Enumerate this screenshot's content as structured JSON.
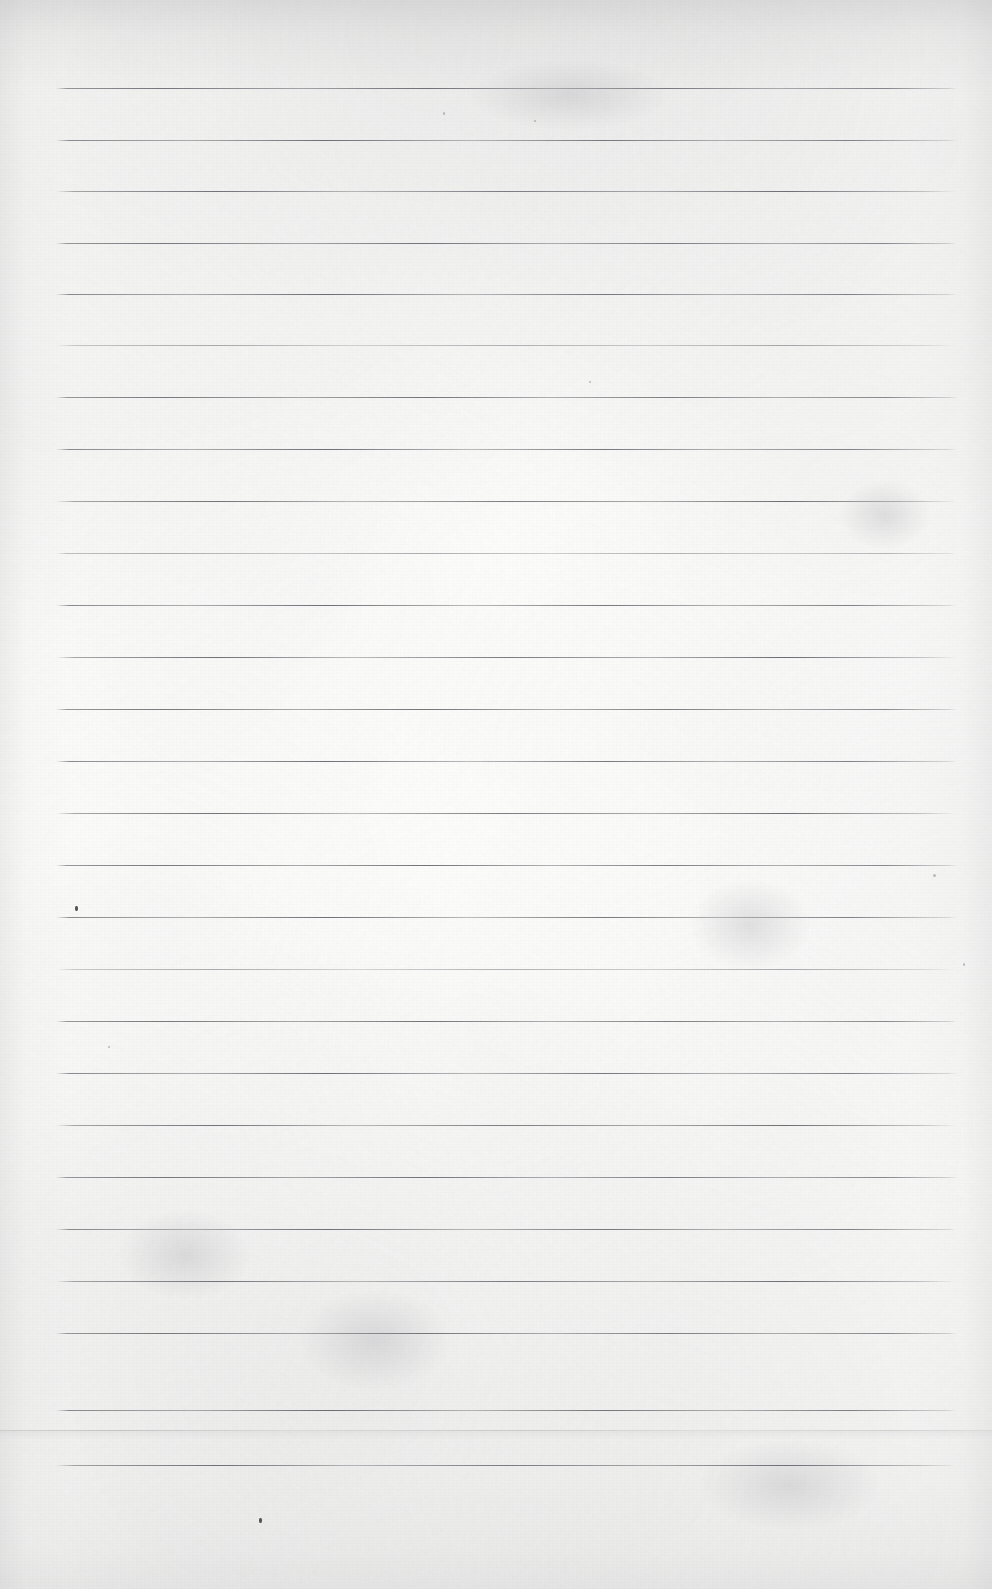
{
  "document": {
    "kind": "scanned-blank-ruled-notebook-page",
    "description": "Blank lined (ruled) sheet of notebook paper, scanned. No handwriting or printed text.",
    "page_width": 992,
    "page_height": 1589,
    "paper_color": "#fbfbfa",
    "rule_color": "#6a6870",
    "seam_color": "#969699",
    "speck_color": "#28262c",
    "text_content": ""
  },
  "ruling": {
    "line_count": 27,
    "line_left_x": 56,
    "line_right_x": 957,
    "line_length": 901,
    "line_spacing": 52,
    "first_line_y": 88,
    "last_line_y": 1465,
    "line_thickness": 1,
    "lines": [
      {
        "index": 1,
        "y": 88,
        "variant": "v1",
        "weight": "strong"
      },
      {
        "index": 2,
        "y": 140,
        "variant": "v2",
        "weight": "normal"
      },
      {
        "index": 3,
        "y": 191,
        "variant": "v3",
        "weight": "normal"
      },
      {
        "index": 4,
        "y": 243,
        "variant": "v1",
        "weight": "normal"
      },
      {
        "index": 5,
        "y": 294,
        "variant": "v2",
        "weight": "strong"
      },
      {
        "index": 6,
        "y": 345,
        "variant": "v3",
        "weight": "faint"
      },
      {
        "index": 7,
        "y": 397,
        "variant": "v1",
        "weight": "normal"
      },
      {
        "index": 8,
        "y": 449,
        "variant": "v2",
        "weight": "normal"
      },
      {
        "index": 9,
        "y": 501,
        "variant": "v3",
        "weight": "normal"
      },
      {
        "index": 10,
        "y": 553,
        "variant": "v1",
        "weight": "faint"
      },
      {
        "index": 11,
        "y": 605,
        "variant": "v2",
        "weight": "normal"
      },
      {
        "index": 12,
        "y": 657,
        "variant": "v3",
        "weight": "strong"
      },
      {
        "index": 13,
        "y": 709,
        "variant": "v1",
        "weight": "normal"
      },
      {
        "index": 14,
        "y": 761,
        "variant": "v2",
        "weight": "normal"
      },
      {
        "index": 15,
        "y": 813,
        "variant": "v3",
        "weight": "normal"
      },
      {
        "index": 16,
        "y": 865,
        "variant": "v1",
        "weight": "normal"
      },
      {
        "index": 17,
        "y": 917,
        "variant": "v2",
        "weight": "normal"
      },
      {
        "index": 18,
        "y": 969,
        "variant": "v3",
        "weight": "faint"
      },
      {
        "index": 19,
        "y": 1021,
        "variant": "v1",
        "weight": "normal"
      },
      {
        "index": 20,
        "y": 1073,
        "variant": "v2",
        "weight": "normal"
      },
      {
        "index": 21,
        "y": 1125,
        "variant": "v3",
        "weight": "normal"
      },
      {
        "index": 22,
        "y": 1177,
        "variant": "v1",
        "weight": "strong"
      },
      {
        "index": 23,
        "y": 1229,
        "variant": "v2",
        "weight": "normal"
      },
      {
        "index": 24,
        "y": 1281,
        "variant": "v3",
        "weight": "normal"
      },
      {
        "index": 25,
        "y": 1333,
        "variant": "v1",
        "weight": "normal"
      },
      {
        "index": 26,
        "y": 1410,
        "variant": "v2",
        "weight": "strong"
      },
      {
        "index": 27,
        "y": 1465,
        "variant": "v3",
        "weight": "strong"
      }
    ]
  },
  "artifacts": {
    "seam": {
      "y": 1430,
      "label": "paper-sheet-edge-seam"
    },
    "specks": [
      {
        "x": 259,
        "y": 1518,
        "w": 3,
        "h": 5,
        "kind": "dark"
      },
      {
        "x": 75,
        "y": 906,
        "w": 3,
        "h": 5,
        "kind": "dark"
      },
      {
        "x": 443,
        "y": 112,
        "w": 2,
        "h": 3,
        "kind": "soft"
      },
      {
        "x": 534,
        "y": 120,
        "w": 2,
        "h": 2,
        "kind": "soft"
      },
      {
        "x": 589,
        "y": 381,
        "w": 2,
        "h": 2,
        "kind": "soft"
      },
      {
        "x": 108,
        "y": 1046,
        "w": 2,
        "h": 2,
        "kind": "soft"
      },
      {
        "x": 963,
        "y": 963,
        "w": 2,
        "h": 3,
        "kind": "soft"
      },
      {
        "x": 933,
        "y": 874,
        "w": 3,
        "h": 3,
        "kind": "soft"
      }
    ],
    "smudges": [
      {
        "x": 840,
        "y": 480,
        "w": 90,
        "h": 70
      },
      {
        "x": 690,
        "y": 880,
        "w": 120,
        "h": 90
      },
      {
        "x": 300,
        "y": 1290,
        "w": 150,
        "h": 100
      },
      {
        "x": 120,
        "y": 1210,
        "w": 130,
        "h": 90
      },
      {
        "x": 470,
        "y": 60,
        "w": 200,
        "h": 70
      },
      {
        "x": 700,
        "y": 1440,
        "w": 180,
        "h": 90
      }
    ]
  }
}
